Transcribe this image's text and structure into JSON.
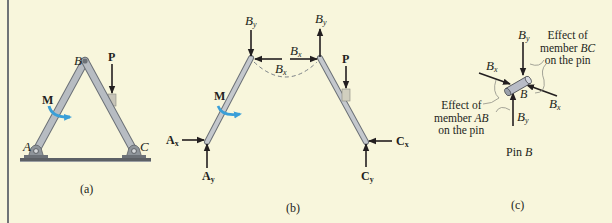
{
  "figure": {
    "background_color": "#f8f6dc",
    "member_color": "#b9bec4",
    "moment_color": "#3a9fd8",
    "panels": [
      {
        "id": "a",
        "caption": "(a)",
        "labels": {
          "A": "A",
          "B": "B",
          "C": "C",
          "P": "P",
          "M": "M"
        }
      },
      {
        "id": "b",
        "caption": "(b)",
        "labels": {
          "By_left": "B",
          "By_left_sub": "y",
          "Bx_left": "B",
          "Bx_left_sub": "x",
          "Bx_right": "B",
          "Bx_right_sub": "x",
          "By_right": "B",
          "By_right_sub": "y",
          "P": "P",
          "M": "M",
          "Ax": "A",
          "Ax_sub": "x",
          "Ay": "A",
          "Ay_sub": "y",
          "Cx": "C",
          "Cx_sub": "x",
          "Cy": "C",
          "Cy_sub": "y"
        }
      },
      {
        "id": "c",
        "caption": "(c)",
        "title": "Pin B",
        "title_prefix": "Pin ",
        "title_var": "B",
        "labels": {
          "By_top": "B",
          "By_top_sub": "y",
          "Bx_left": "B",
          "Bx_left_sub": "x",
          "Bx_right": "B",
          "Bx_right_sub": "x",
          "By_bottom": "B",
          "By_bottom_sub": "y",
          "pin": "B"
        },
        "note_bc": {
          "line1": "Effect of",
          "line2_prefix": "member ",
          "line2_var": "BC",
          "line3": "on the pin"
        },
        "note_ab": {
          "line1": "Effect of",
          "line2_prefix": "member ",
          "line2_var": "AB",
          "line3": "on the pin"
        }
      }
    ]
  }
}
